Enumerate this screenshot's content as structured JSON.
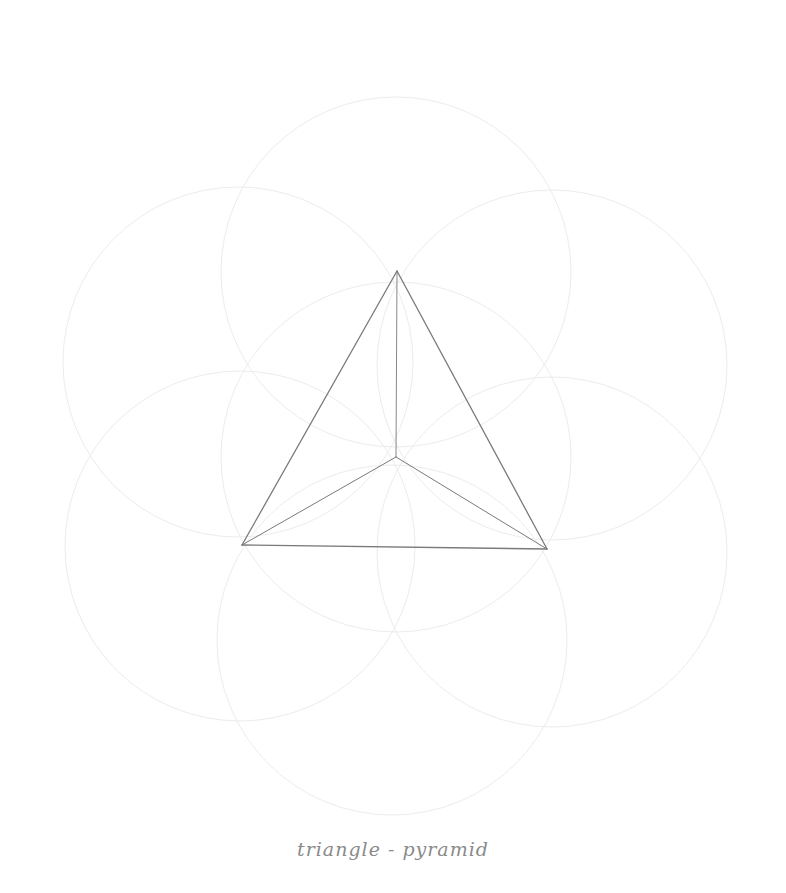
{
  "drawing": {
    "caption": "triangle - pyramid",
    "colors": {
      "background": "#ffffff",
      "construction_circles": "#ececec",
      "pyramid_lines": "#7a7a7a",
      "caption": "#8a8a8a"
    },
    "circle_radius": 175,
    "circles": [
      {
        "cx": 396,
        "cy": 457
      },
      {
        "cx": 396,
        "cy": 272
      },
      {
        "cx": 238,
        "cy": 362
      },
      {
        "cx": 552,
        "cy": 365
      },
      {
        "cx": 240,
        "cy": 546
      },
      {
        "cx": 552,
        "cy": 552
      },
      {
        "cx": 392,
        "cy": 640
      }
    ],
    "pyramid": {
      "apex": [
        397,
        271
      ],
      "left": [
        242,
        545
      ],
      "right": [
        547,
        549
      ],
      "center": [
        396,
        457
      ]
    }
  }
}
